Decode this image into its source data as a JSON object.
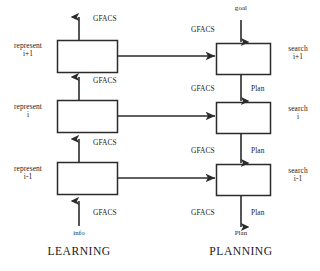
{
  "figure": {
    "columns": {
      "learning": {
        "title": "LEARNING",
        "boxes": [
          {
            "label_line1": "represent",
            "label_line2": "i+1"
          },
          {
            "label_line1": "represent",
            "label_line2": "i"
          },
          {
            "label_line1": "represent",
            "label_line2": "i-1"
          }
        ],
        "arrow_labels": {
          "top_output": "GFACS",
          "between_top_mid": "GFACS",
          "between_mid_bottom": "GFACS",
          "bottom_input": "GFACS"
        },
        "input_label": "info"
      },
      "planning": {
        "title": "PLANNING",
        "boxes": [
          {
            "label_line1": "search",
            "label_line2": "i+1"
          },
          {
            "label_line1": "search",
            "label_line2": "i"
          },
          {
            "label_line1": "search",
            "label_line2": "i-1"
          }
        ],
        "top_input_label": "goal",
        "arrow_labels": {
          "top_left": "GFACS",
          "mid_upper_left": "GFACS",
          "mid_upper_right": "Plan",
          "mid_lower_left": "GFACS",
          "mid_lower_right": "Plan",
          "bottom_left": "GFACS",
          "bottom_right": "Plan"
        },
        "output_label": "Plan"
      }
    },
    "colors": {
      "stroke": "#2b2b2b",
      "text": "#1b1b1b",
      "background": "#ffffff"
    }
  }
}
